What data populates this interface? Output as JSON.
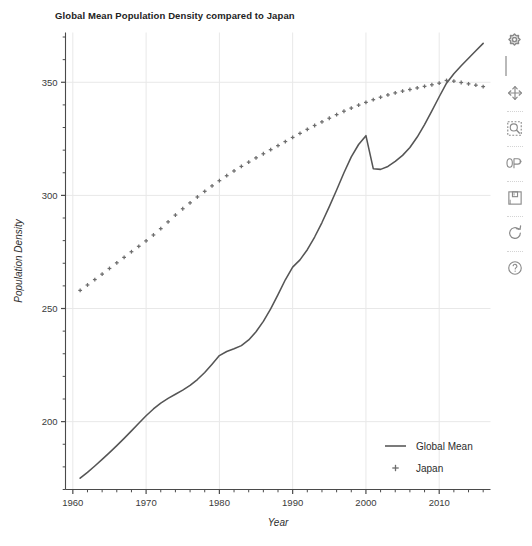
{
  "chart_data": {
    "type": "line",
    "title": "Global Mean Population Density compared to Japan",
    "xlabel": "Year",
    "ylabel": "Population Density",
    "xlim": [
      1959,
      2017
    ],
    "ylim": [
      170,
      372
    ],
    "xticks": [
      1960,
      1970,
      1980,
      1990,
      2000,
      2010
    ],
    "yticks": [
      200,
      250,
      300,
      350
    ],
    "xtick_labels": [
      "1960",
      "1970",
      "1980",
      "1990",
      "2000",
      "2010"
    ],
    "ytick_labels": [
      "200",
      "250",
      "300",
      "350"
    ],
    "x_minor_tick_step": 2,
    "y_minor_tick_step": 10,
    "grid": true,
    "grid_color": "#e8e8e8",
    "legend_position": "lower right",
    "series": [
      {
        "name": "Global Mean",
        "style": "solid-line",
        "color": "#555555",
        "x": [
          1961,
          1962,
          1963,
          1964,
          1965,
          1966,
          1967,
          1968,
          1969,
          1970,
          1971,
          1972,
          1973,
          1974,
          1975,
          1976,
          1977,
          1978,
          1979,
          1980,
          1981,
          1982,
          1983,
          1984,
          1985,
          1986,
          1987,
          1988,
          1989,
          1990,
          1991,
          1992,
          1993,
          1994,
          1995,
          1996,
          1997,
          1998,
          1999,
          2000,
          2001,
          2002,
          2003,
          2004,
          2005,
          2006,
          2007,
          2008,
          2009,
          2010,
          2011,
          2012,
          2013,
          2014,
          2015,
          2016
        ],
        "values": [
          175.0,
          177.6,
          180.4,
          183.3,
          186.3,
          189.4,
          192.6,
          195.9,
          199.3,
          202.6,
          205.6,
          208.2,
          210.3,
          212.1,
          213.9,
          216.0,
          218.6,
          221.7,
          225.4,
          229.2,
          231.0,
          232.2,
          233.6,
          236.1,
          239.7,
          244.3,
          249.8,
          256.1,
          262.7,
          268.3,
          271.5,
          276.0,
          281.6,
          288.0,
          295.0,
          302.4,
          310.0,
          317.0,
          322.5,
          326.4,
          311.8,
          311.5,
          312.8,
          315.0,
          317.7,
          321.2,
          325.8,
          331.3,
          337.4,
          343.6,
          349.6,
          353.8,
          357.3,
          360.6,
          363.9,
          367.2
        ]
      },
      {
        "name": "Japan",
        "style": "plus-markers",
        "color": "#6d6d6d",
        "x": [
          1961,
          1962,
          1963,
          1964,
          1965,
          1966,
          1967,
          1968,
          1969,
          1970,
          1971,
          1972,
          1973,
          1974,
          1975,
          1976,
          1977,
          1978,
          1979,
          1980,
          1981,
          1982,
          1983,
          1984,
          1985,
          1986,
          1987,
          1988,
          1989,
          1990,
          1991,
          1992,
          1993,
          1994,
          1995,
          1996,
          1997,
          1998,
          1999,
          2000,
          2001,
          2002,
          2003,
          2004,
          2005,
          2006,
          2007,
          2008,
          2009,
          2010,
          2011,
          2012,
          2013,
          2014,
          2015,
          2016
        ],
        "values": [
          258.0,
          260.4,
          262.8,
          265.2,
          267.7,
          270.2,
          272.6,
          275.1,
          277.5,
          279.9,
          282.5,
          285.3,
          288.3,
          291.3,
          294.1,
          296.7,
          299.3,
          301.8,
          304.2,
          306.5,
          308.7,
          310.8,
          312.8,
          314.7,
          316.6,
          318.4,
          320.2,
          322.0,
          323.8,
          325.6,
          327.4,
          329.2,
          330.9,
          332.5,
          334.1,
          335.7,
          337.2,
          338.6,
          339.9,
          341.1,
          342.3,
          343.4,
          344.4,
          345.3,
          346.1,
          346.8,
          347.5,
          348.2,
          348.9,
          349.6,
          350.8,
          350.5,
          349.9,
          349.3,
          348.7,
          348.1
        ]
      }
    ],
    "legend": [
      {
        "label": "Global Mean",
        "marker": "line"
      },
      {
        "label": "Japan",
        "marker": "plus"
      }
    ]
  },
  "toolbar": {
    "items": [
      {
        "name": "home-icon",
        "tooltip": "Reset original view"
      },
      {
        "name": "move-icon",
        "tooltip": "Pan axes with left mouse, zoom with right"
      },
      {
        "name": "zoom-icon",
        "tooltip": "Zoom to rectangle"
      },
      {
        "name": "subplots-icon",
        "tooltip": "Configure subplots"
      },
      {
        "name": "save-icon",
        "tooltip": "Save the figure"
      },
      {
        "name": "refresh-icon",
        "tooltip": "Refresh"
      },
      {
        "name": "help-icon",
        "tooltip": "Help"
      }
    ]
  }
}
